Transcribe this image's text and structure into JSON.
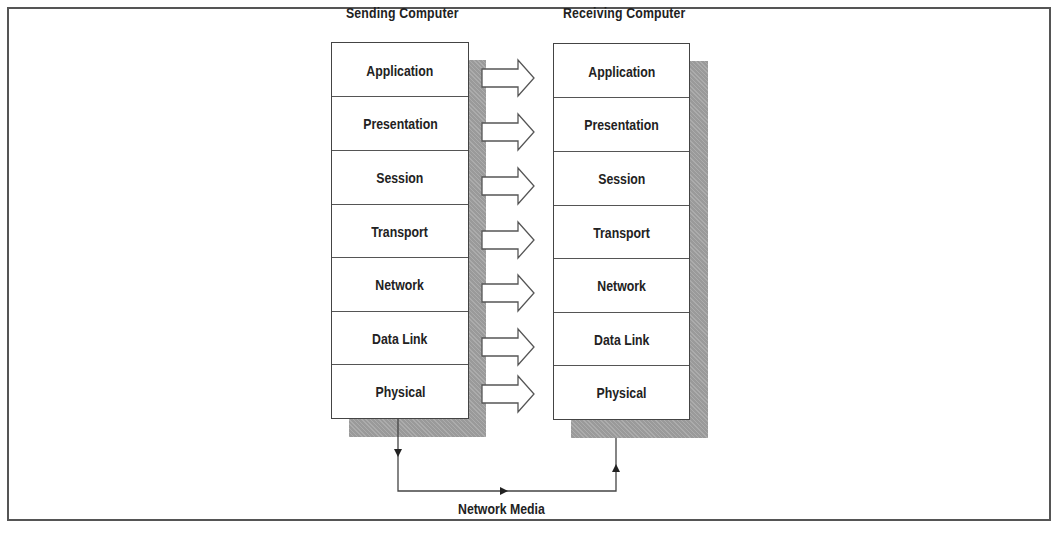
{
  "diagram": {
    "type": "osi-model-communication",
    "sending": {
      "title": "Sending Computer",
      "layers": [
        "Application",
        "Presentation",
        "Session",
        "Transport",
        "Network",
        "Data Link",
        "Physical"
      ]
    },
    "receiving": {
      "title": "Receiving Computer",
      "layers": [
        "Application",
        "Presentation",
        "Session",
        "Transport",
        "Network",
        "Data Link",
        "Physical"
      ]
    },
    "media_label": "Network Media",
    "colors": {
      "line": "#444444",
      "shadow": "#9a9a9a",
      "background": "#ffffff",
      "text": "#222222"
    }
  }
}
